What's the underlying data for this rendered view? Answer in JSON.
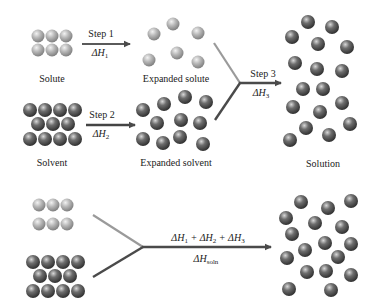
{
  "diagram": {
    "colors": {
      "solute_sphere": "#b5b5b5",
      "solvent_sphere": "#6a6a6a",
      "solute_line": "#9a9a9a",
      "solvent_line": "#4a4a4a",
      "arrow": "#4a4a4a"
    },
    "labels": {
      "solute": "Solute",
      "expanded_solute": "Expanded solute",
      "solvent": "Solvent",
      "expanded_solvent": "Expanded solvent",
      "solution": "Solution"
    },
    "steps": [
      {
        "label": "Step 1",
        "delta": "ΔH",
        "sub": "1"
      },
      {
        "label": "Step 2",
        "delta": "ΔH",
        "sub": "2"
      },
      {
        "label": "Step 3",
        "delta": "ΔH",
        "sub": "3"
      }
    ],
    "overall": {
      "sum": {
        "t1": "ΔH",
        "s1": "1",
        "p1": " + ΔH",
        "s2": "2",
        "p2": " + ΔH",
        "s3": "3"
      },
      "delta": "ΔH",
      "sub": "soln"
    },
    "groups": {
      "solute": [
        [
          38,
          36
        ],
        [
          52,
          36
        ],
        [
          66,
          36
        ],
        [
          38,
          50
        ],
        [
          52,
          50
        ],
        [
          66,
          50
        ]
      ],
      "expanded_solute": [
        [
          154,
          34
        ],
        [
          173,
          24
        ],
        [
          198,
          33
        ],
        [
          149,
          60
        ],
        [
          177,
          53
        ],
        [
          198,
          62
        ]
      ],
      "solvent": [
        [
          30,
          110
        ],
        [
          45,
          110
        ],
        [
          60,
          110
        ],
        [
          75,
          110
        ],
        [
          38,
          124
        ],
        [
          53,
          124
        ],
        [
          68,
          124
        ],
        [
          30,
          139
        ],
        [
          45,
          139
        ],
        [
          60,
          139
        ],
        [
          75,
          139
        ]
      ],
      "expanded_solvent": [
        [
          143,
          110
        ],
        [
          164,
          104
        ],
        [
          185,
          97
        ],
        [
          206,
          102
        ],
        [
          157,
          123
        ],
        [
          181,
          120
        ],
        [
          200,
          123
        ],
        [
          143,
          139
        ],
        [
          163,
          143
        ],
        [
          180,
          137
        ],
        [
          203,
          144
        ]
      ],
      "solution_solute": [
        [
          308,
          22
        ],
        [
          332,
          27
        ],
        [
          292,
          37
        ],
        [
          318,
          44
        ],
        [
          347,
          47
        ],
        [
          295,
          63
        ]
      ],
      "solution_solvent": [
        [
          317,
          69
        ],
        [
          342,
          71
        ],
        [
          303,
          89
        ],
        [
          323,
          89
        ],
        [
          293,
          107
        ],
        [
          320,
          112
        ],
        [
          342,
          103
        ],
        [
          306,
          128
        ],
        [
          350,
          124
        ],
        [
          290,
          140
        ],
        [
          329,
          135
        ]
      ],
      "bottom_solute": [
        [
          39,
          205
        ],
        [
          53,
          205
        ],
        [
          67,
          205
        ],
        [
          39,
          224
        ],
        [
          53,
          224
        ],
        [
          67,
          224
        ]
      ],
      "bottom_solvent": [
        [
          33,
          262
        ],
        [
          48,
          262
        ],
        [
          63,
          262
        ],
        [
          78,
          262
        ],
        [
          40,
          276
        ],
        [
          55,
          276
        ],
        [
          70,
          276
        ],
        [
          33,
          291
        ],
        [
          48,
          291
        ],
        [
          63,
          291
        ],
        [
          78,
          291
        ]
      ],
      "bottom_solution": [
        [
          301,
          202
        ],
        [
          328,
          208
        ],
        [
          351,
          201
        ],
        [
          286,
          218
        ],
        [
          315,
          223
        ],
        [
          342,
          227
        ],
        [
          292,
          234
        ],
        [
          325,
          243
        ],
        [
          351,
          244
        ],
        [
          305,
          250
        ],
        [
          338,
          257
        ],
        [
          287,
          258
        ],
        [
          307,
          272
        ],
        [
          326,
          271
        ],
        [
          351,
          275
        ],
        [
          289,
          289
        ],
        [
          331,
          290
        ]
      ]
    }
  }
}
